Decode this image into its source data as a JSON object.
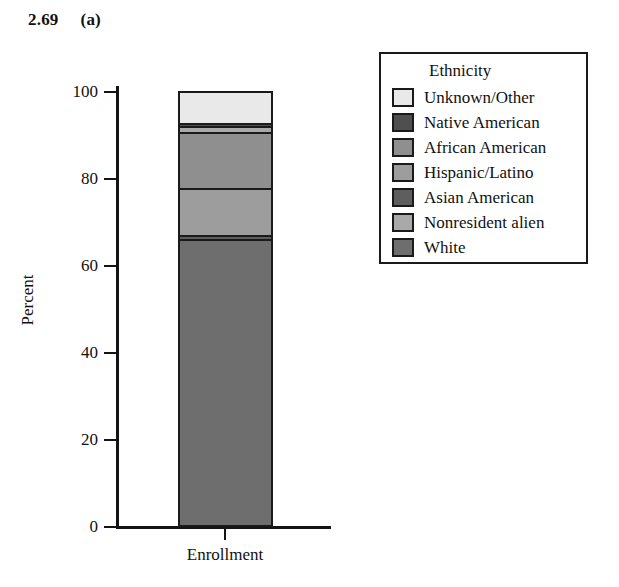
{
  "header": {
    "figure_number": "2.69",
    "panel_label": "(a)"
  },
  "legend": {
    "title": "Ethnicity",
    "position": "right",
    "items": [
      {
        "label": "Unknown/Other",
        "color": "#e9e9e9"
      },
      {
        "label": "Native American",
        "color": "#4f4f4f"
      },
      {
        "label": "African American",
        "color": "#8f8f8f"
      },
      {
        "label": "Hispanic/Latino",
        "color": "#9d9d9d"
      },
      {
        "label": "Asian American",
        "color": "#5e5e5e"
      },
      {
        "label": "Nonresident alien",
        "color": "#a9a9a9"
      },
      {
        "label": "White",
        "color": "#6e6e6e"
      }
    ]
  },
  "axes": {
    "y_title": "Percent",
    "y_ticks": [
      "0",
      "20",
      "40",
      "60",
      "80",
      "100"
    ],
    "x_categories": [
      "Enrollment"
    ]
  },
  "chart_data": {
    "type": "bar",
    "subtype": "stacked-percent-bar",
    "title": "",
    "xlabel": "",
    "ylabel": "Percent",
    "ylim": [
      0,
      100
    ],
    "yticks": [
      0,
      20,
      40,
      60,
      80,
      100
    ],
    "grid": false,
    "legend_title": "Ethnicity",
    "legend_position": "right",
    "categories": [
      "Enrollment"
    ],
    "stack_order_bottom_to_top": [
      "White",
      "Asian American",
      "Hispanic/Latino",
      "African American",
      "Nonresident alien",
      "Native American",
      "Unknown/Other"
    ],
    "series": [
      {
        "name": "White",
        "values": [
          65.7
        ],
        "color": "#6e6e6e"
      },
      {
        "name": "Asian American",
        "values": [
          1.0
        ],
        "color": "#5e5e5e"
      },
      {
        "name": "Hispanic/Latino",
        "values": [
          10.8
        ],
        "color": "#9d9d9d"
      },
      {
        "name": "African American",
        "values": [
          12.9
        ],
        "color": "#8f8f8f"
      },
      {
        "name": "Nonresident alien",
        "values": [
          1.6
        ],
        "color": "#a9a9a9"
      },
      {
        "name": "Native American",
        "values": [
          0.5
        ],
        "color": "#4f4f4f"
      },
      {
        "name": "Unknown/Other",
        "values": [
          7.5
        ],
        "color": "#e9e9e9"
      }
    ],
    "total": 100
  }
}
